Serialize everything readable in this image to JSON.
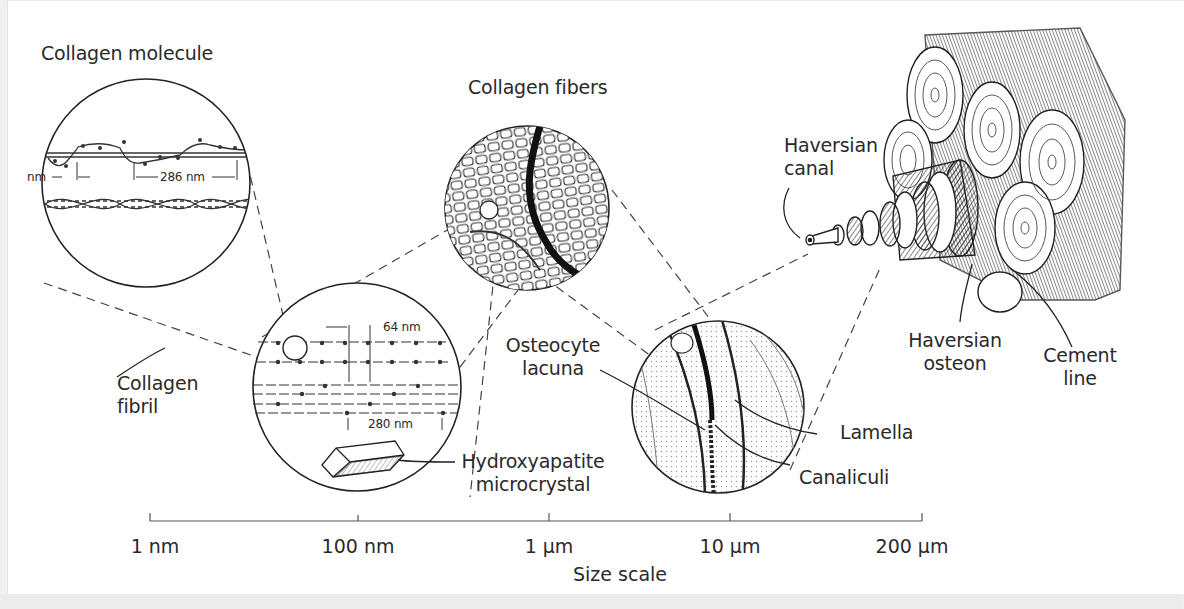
{
  "figure": {
    "panels": {
      "collagen_molecule": {
        "title": "Collagen molecule",
        "measure_left": "nm",
        "measure_right": "286 nm"
      },
      "collagen_fibril": {
        "label_line1": "Collagen",
        "label_line2": "fibril",
        "measure_top": "64 nm",
        "measure_bottom": "280 nm"
      },
      "hydroxyapatite": {
        "label_line1": "Hydroxyapatite",
        "label_line2": "microcrystal"
      },
      "collagen_fibers": {
        "title": "Collagen fibers"
      },
      "lamella_panel": {
        "osteocyte_line1": "Osteocyte",
        "osteocyte_line2": "lacuna",
        "lamella": "Lamella",
        "canaliculi": "Canaliculi"
      },
      "osteon_bundle": {
        "haversian_canal_line1": "Haversian",
        "haversian_canal_line2": "canal",
        "haversian_osteon_line1": "Haversian",
        "haversian_osteon_line2": "osteon",
        "cement_line_line1": "Cement",
        "cement_line_line2": "line"
      }
    },
    "scale": {
      "title": "Size scale",
      "ticks": [
        "1 nm",
        "100 nm",
        "1 µm",
        "10 µm",
        "200 µm"
      ]
    }
  }
}
